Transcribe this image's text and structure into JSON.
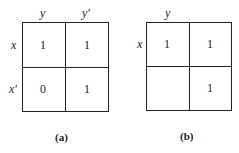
{
  "diagrams": [
    {
      "caption": "(a)",
      "col_labels": [
        "y",
        "y′"
      ],
      "row_labels": [
        "x",
        "x′"
      ],
      "cells": [
        [
          "1",
          "1"
        ],
        [
          "0",
          "1"
        ]
      ]
    },
    {
      "caption": "(b)",
      "col_labels": [
        "y",
        ""
      ],
      "row_labels": [
        "x",
        ""
      ],
      "cells": [
        [
          "1",
          "1"
        ],
        [
          "",
          "1"
        ]
      ]
    }
  ]
}
